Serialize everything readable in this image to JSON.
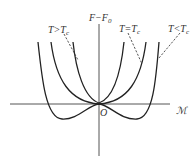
{
  "figure": {
    "y_axis_label": "F−F",
    "y_axis_label_sub": "0",
    "x_axis_label": "ℳ",
    "origin_label": "O",
    "curve_labels": [
      {
        "id": "above",
        "text": "T>T",
        "sub": "c"
      },
      {
        "id": "critical",
        "text": "T=T",
        "sub": "c"
      },
      {
        "id": "below",
        "text": "T<T",
        "sub": "c"
      }
    ]
  },
  "diagram": {
    "type": "free-energy vs magnetization (Landau theory)",
    "curves": [
      {
        "name": "T>Tc",
        "shape": "single minimum at M=0 (parabolic-like)"
      },
      {
        "name": "T=Tc",
        "shape": "flat quartic minimum at M=0"
      },
      {
        "name": "T<Tc",
        "shape": "double well, two symmetric minima below zero"
      }
    ]
  }
}
